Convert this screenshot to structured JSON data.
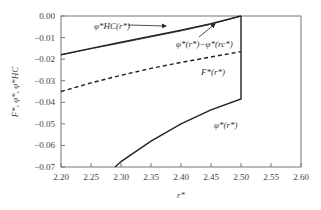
{
  "chart_data": {
    "type": "line",
    "title": "",
    "xlabel": "r*",
    "ylabel": "F*, φ*, φ*HC",
    "xlim": [
      2.2,
      2.6
    ],
    "ylim": [
      -0.07,
      0.0
    ],
    "x_ticks": [
      "2.20",
      "2.25",
      "2.30",
      "2.35",
      "2.40",
      "2.45",
      "2.50",
      "2.55",
      "2.60"
    ],
    "y_ticks": [
      "0.00",
      "−0.01",
      "−0.02",
      "−0.03",
      "−0.04",
      "−0.05",
      "−0.06",
      "−0.07"
    ],
    "grid": false,
    "legend": "inline annotations",
    "series": [
      {
        "name": "φ*HC(r*)",
        "style": "solid",
        "x": [
          2.2,
          2.25,
          2.3,
          2.35,
          2.4,
          2.45,
          2.5
        ],
        "values": [
          -0.018,
          -0.015,
          -0.0122,
          -0.0094,
          -0.0066,
          -0.0036,
          0.0
        ]
      },
      {
        "name": "φ*(r*)−φ*(rc*)",
        "style": "thin-solid",
        "x": [
          2.2,
          2.25,
          2.3,
          2.35,
          2.4,
          2.45,
          2.5
        ],
        "values": [
          -0.018,
          -0.0152,
          -0.0125,
          -0.0097,
          -0.0069,
          -0.0038,
          0.0
        ]
      },
      {
        "name": "F*(r*)",
        "style": "dashed",
        "x": [
          2.2,
          2.25,
          2.3,
          2.35,
          2.4,
          2.45,
          2.5
        ],
        "values": [
          -0.035,
          -0.031,
          -0.0275,
          -0.0243,
          -0.0215,
          -0.019,
          -0.0165
        ]
      },
      {
        "name": "φ*(r*)",
        "style": "solid",
        "x": [
          2.29,
          2.3,
          2.35,
          2.4,
          2.45,
          2.5,
          2.5
        ],
        "values": [
          -0.07,
          -0.0675,
          -0.058,
          -0.05,
          -0.0435,
          -0.0385,
          0.0
        ]
      }
    ],
    "annotations": [
      {
        "text": "φ*HC(r*)",
        "arrow_to": [
          2.37,
          -0.0085
        ]
      },
      {
        "text": "φ*(r*)−φ*(rc*)",
        "arrow_to": [
          2.46,
          -0.003
        ]
      },
      {
        "text": "F*(r*)"
      },
      {
        "text": "φ*(r*)"
      }
    ]
  },
  "labels": {
    "x_axis": "r*",
    "y_axis": "F*, φ*, φ*HC",
    "anno_hc": "φ*HC(r*)",
    "anno_diff": "φ*(r*)−φ*(rc*)",
    "anno_F": "F*(r*)",
    "anno_phi": "φ*(r*)"
  }
}
